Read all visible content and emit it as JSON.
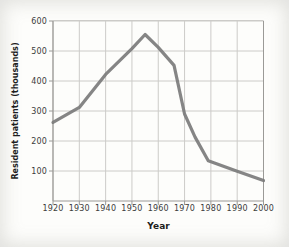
{
  "figure": {
    "kind": "scanned textbook line chart",
    "background": "#fdfdfb"
  },
  "chart_data": {
    "type": "line",
    "title": "",
    "xlabel": "Year",
    "ylabel": "Resident patients (thousands)",
    "xlim": [
      1920,
      2000
    ],
    "ylim": [
      0,
      600
    ],
    "x_ticks": [
      1920,
      1930,
      1940,
      1950,
      1960,
      1970,
      1980,
      1990,
      2000
    ],
    "y_ticks": [
      100,
      200,
      300,
      400,
      500,
      600
    ],
    "grid": true,
    "legend_position": "none",
    "grid_color": "#cccbc8",
    "axis_color": "#9b9a97",
    "series": [
      {
        "name": "Resident patients (thousands)",
        "color": "#7b7b7b",
        "points": [
          {
            "year": 1920,
            "value": 262
          },
          {
            "year": 1930,
            "value": 312
          },
          {
            "year": 1940,
            "value": 422
          },
          {
            "year": 1950,
            "value": 508
          },
          {
            "year": 1955,
            "value": 555
          },
          {
            "year": 1960,
            "value": 512
          },
          {
            "year": 1966,
            "value": 452
          },
          {
            "year": 1970,
            "value": 290
          },
          {
            "year": 1974,
            "value": 213
          },
          {
            "year": 1979,
            "value": 134
          },
          {
            "year": 1990,
            "value": 99
          },
          {
            "year": 2000,
            "value": 68
          }
        ]
      }
    ]
  }
}
